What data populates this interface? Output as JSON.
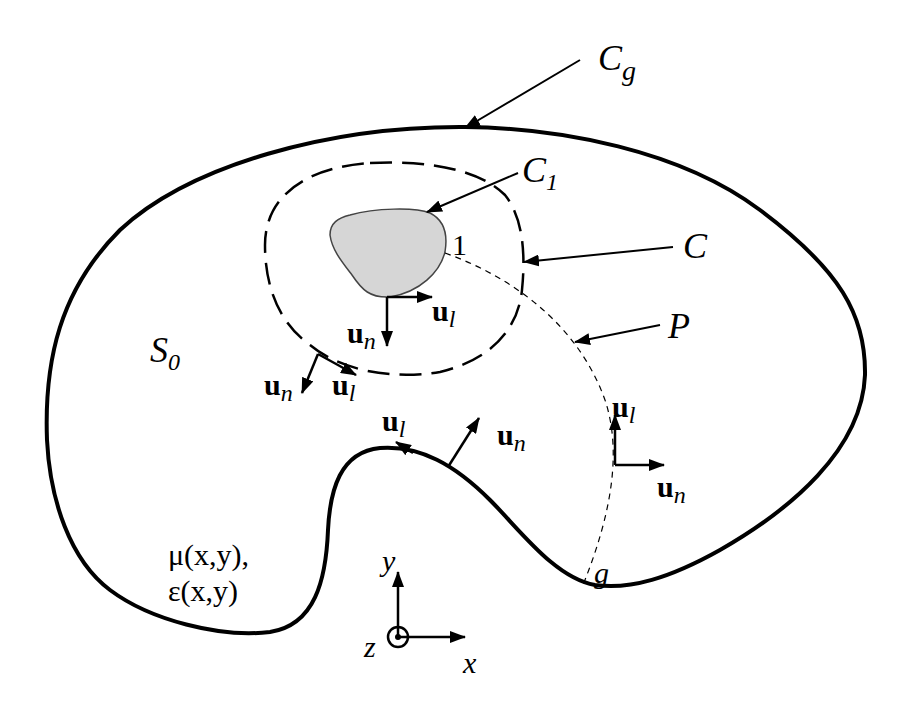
{
  "diagram": {
    "colors": {
      "stroke": "#000000",
      "obstacle_fill": "#d6d6d6",
      "background": "#ffffff"
    },
    "curves": {
      "outer_boundary": {
        "name": "C",
        "subscript": "g"
      },
      "inner_contour": {
        "name": "C"
      },
      "obstacle_boundary": {
        "name": "C",
        "subscript": "1"
      },
      "path": {
        "name": "P"
      }
    },
    "labels": {
      "Cg": {
        "main": "C",
        "sub": "g"
      },
      "C1": {
        "main": "C",
        "sub": "1"
      },
      "C": {
        "main": "C"
      },
      "P": {
        "main": "P"
      },
      "S0": {
        "main": "S",
        "sub": "0"
      },
      "point1": "1",
      "pointg": "g",
      "material_mu": "μ(x,y),",
      "material_eps": "ε(x,y)",
      "axis_x": "x",
      "axis_y": "y",
      "axis_z": "z"
    },
    "vectors": {
      "u": "u",
      "n_sub": "n",
      "l_sub": "l"
    }
  }
}
